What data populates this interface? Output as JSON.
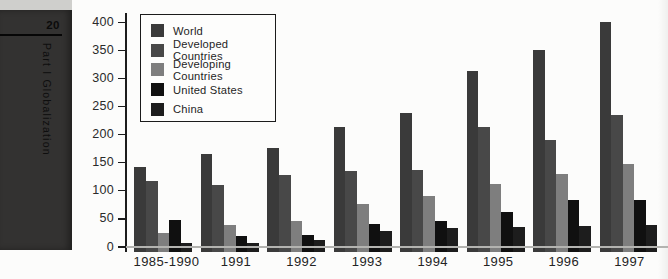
{
  "sidebar": {
    "page_number": "20",
    "section_title": "Part I Globalization"
  },
  "chart_data": {
    "type": "bar",
    "title": "",
    "xlabel": "",
    "ylabel": "",
    "categories": [
      "1985-1990",
      "1991",
      "1992",
      "1993",
      "1994",
      "1995",
      "1996",
      "1997"
    ],
    "series": [
      {
        "name": "World",
        "color": "#3a3a3a",
        "values": [
          142,
          165,
          176,
          213,
          239,
          313,
          350,
          400
        ]
      },
      {
        "name": "Developed Countries",
        "color": "#484848",
        "values": [
          117,
          110,
          128,
          135,
          137,
          213,
          190,
          235
        ]
      },
      {
        "name": "Developing Countries",
        "color": "#7e7e7e",
        "values": [
          25,
          40,
          47,
          77,
          90,
          113,
          130,
          148
        ]
      },
      {
        "name": "United States",
        "color": "#101010",
        "values": [
          48,
          20,
          22,
          41,
          46,
          63,
          83,
          84
        ]
      },
      {
        "name": "China",
        "color": "#1d1d1d",
        "values": [
          8,
          8,
          12,
          28,
          34,
          36,
          37,
          40
        ]
      }
    ],
    "ylim": [
      0,
      400
    ],
    "yticks": [
      0,
      50,
      100,
      150,
      200,
      250,
      300,
      350,
      400
    ],
    "legend_position": "top-left",
    "grid": false
  }
}
